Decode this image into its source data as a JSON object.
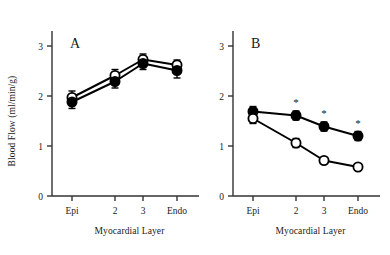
{
  "figure": {
    "type": "line-chart-figure",
    "panels": [
      "A",
      "B"
    ],
    "shared_ylabel": "Blood Flow (ml/min/g)",
    "shared_xlabel": "Myocardial Layer"
  },
  "chart_data": [
    {
      "type": "line",
      "panel": "A",
      "title": "A",
      "xlabel": "Myocardial Layer",
      "ylabel": "Blood Flow (ml/min/g)",
      "categories": [
        "Epi",
        "2",
        "3",
        "Endo"
      ],
      "ylim": [
        0,
        3
      ],
      "yticks": [
        0,
        1,
        2,
        3
      ],
      "ytick_labels": [
        "0",
        "1",
        "2",
        "3"
      ],
      "grid": false,
      "legend": "none",
      "series": [
        {
          "name": "open-circle",
          "marker": "open circle",
          "values": [
            1.97,
            2.41,
            2.73,
            2.62
          ],
          "errors": [
            0.13,
            0.12,
            0.11,
            0.1
          ]
        },
        {
          "name": "filled-circle",
          "marker": "filled circle",
          "values": [
            1.88,
            2.29,
            2.65,
            2.51
          ],
          "errors": [
            0.13,
            0.13,
            0.12,
            0.15
          ]
        }
      ],
      "annotations": []
    },
    {
      "type": "line",
      "panel": "B",
      "title": "B",
      "xlabel": "Myocardial Layer",
      "ylabel": "Blood Flow (ml/min/g)",
      "categories": [
        "Epi",
        "2",
        "3",
        "Endo"
      ],
      "ylim": [
        0,
        3
      ],
      "yticks": [
        0,
        1,
        2,
        3
      ],
      "ytick_labels": [
        "0",
        "1",
        "2",
        "3"
      ],
      "grid": false,
      "legend": "none",
      "series": [
        {
          "name": "filled-circle",
          "marker": "filled circle",
          "values": [
            1.69,
            1.61,
            1.39,
            1.2
          ],
          "errors": [
            0.1,
            0.09,
            0.09,
            0.09
          ]
        },
        {
          "name": "open-circle",
          "marker": "open circle",
          "values": [
            1.55,
            1.06,
            0.71,
            0.58
          ],
          "errors": [
            0.1,
            0.09,
            0.0,
            0.0
          ]
        }
      ],
      "annotations": [
        {
          "text": "*",
          "category": "2",
          "series": "filled-circle"
        },
        {
          "text": "*",
          "category": "3",
          "series": "filled-circle"
        },
        {
          "text": "*",
          "category": "Endo",
          "series": "filled-circle"
        }
      ]
    }
  ],
  "labels": {
    "panel_a": "A",
    "panel_b": "B",
    "ylabel": "Blood Flow (ml/min/g)",
    "xlabel_a": "Myocardial Layer",
    "xlabel_b": "Myocardial Layer",
    "ytick_0": "0",
    "ytick_1": "1",
    "ytick_2": "2",
    "ytick_3": "3",
    "xtick_epi": "Epi",
    "xtick_2": "2",
    "xtick_3": "3",
    "xtick_endo": "Endo",
    "star": "*"
  },
  "colors": {
    "axis": "#333333",
    "line": "#000000",
    "marker_fill": "#000000",
    "marker_open": "#ffffff",
    "text": "#1a1a1a",
    "background": "#ffffff"
  }
}
